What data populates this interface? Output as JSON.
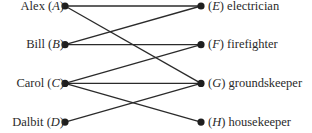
{
  "diagram": {
    "type": "bipartite-graph",
    "left_nodes": [
      {
        "id": "A",
        "name": "Alex",
        "var": "A"
      },
      {
        "id": "B",
        "name": "Bill",
        "var": "B"
      },
      {
        "id": "C",
        "name": "Carol",
        "var": "C"
      },
      {
        "id": "D",
        "name": "Dalbit",
        "var": "D"
      }
    ],
    "right_nodes": [
      {
        "id": "E",
        "name": "electrician",
        "var": "E"
      },
      {
        "id": "F",
        "name": "firefighter",
        "var": "F"
      },
      {
        "id": "G",
        "name": "groundskeeper",
        "var": "G"
      },
      {
        "id": "H",
        "name": "housekeeper",
        "var": "H"
      }
    ],
    "edges": [
      [
        "A",
        "E"
      ],
      [
        "A",
        "G"
      ],
      [
        "B",
        "E"
      ],
      [
        "B",
        "F"
      ],
      [
        "C",
        "F"
      ],
      [
        "C",
        "G"
      ],
      [
        "C",
        "H"
      ],
      [
        "D",
        "G"
      ]
    ],
    "colors": {
      "line": "#2b2b2b",
      "node": "#1e1e1e",
      "text": "#2a2a2a"
    }
  }
}
